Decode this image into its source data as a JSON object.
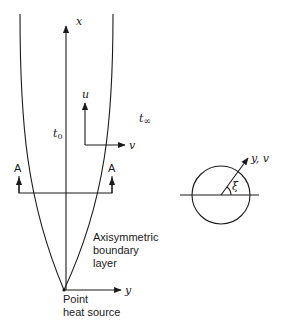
{
  "figure": {
    "type": "diagram",
    "labels": {
      "x_axis": "x",
      "y_axis": "y",
      "u_velocity": "u",
      "v_velocity": "v",
      "t_inner": "t",
      "t_inner_sub": "0",
      "t_outer": "t",
      "t_outer_sub": "∞",
      "section_left": "A",
      "section_right": "A",
      "boundary_layer_line1": "Axisymmetric",
      "boundary_layer_line2": "boundary",
      "boundary_layer_line3": "layer",
      "source_line1": "Point",
      "source_line2": "heat source",
      "section_view_axis": "y, v",
      "angle": "ξ"
    },
    "colors": {
      "ink": "#1a1a1a",
      "background": "#ffffff"
    }
  }
}
